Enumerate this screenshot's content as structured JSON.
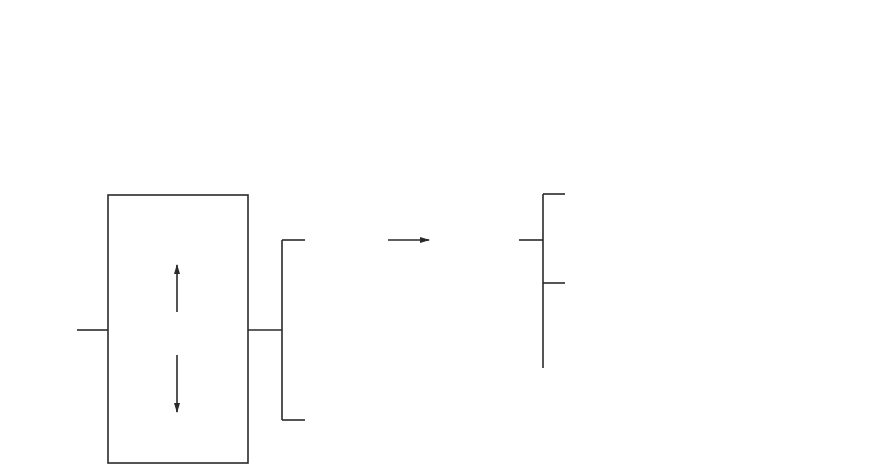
{
  "top_fragment": "group",
  "root": {
    "line1": "human",
    "line2": "activity"
  },
  "box": {
    "top": {
      "line1": "common",
      "line2": "property",
      "line3": "protection"
    },
    "center": "individualism",
    "bottom": {
      "line1": "profit",
      "line2": "maximisation"
    }
  },
  "malefits": {
    "line1": "malefits",
    "line2": "(latent)"
  },
  "benefits": {
    "line1": "benefits",
    "line2": "(manifest)"
  },
  "manifest": "(manifest)",
  "responses": [
    {
      "line1": "active",
      "line2": "participant"
    },
    {
      "line1": "fatalist"
    },
    {
      "line1": "unaffected"
    },
    {
      "line1": "unaware"
    }
  ],
  "actors": [
    {
      "line1": "ideological",
      "line2": "actor"
    },
    {
      "line1": "civic",
      "line2": "actor"
    },
    {
      "line1": "private",
      "line2": "actor"
    }
  ],
  "groups": [
    {
      "line1": "instrumental",
      "line2": "group"
    },
    {
      "line1": "expressive",
      "line2": "group"
    }
  ]
}
